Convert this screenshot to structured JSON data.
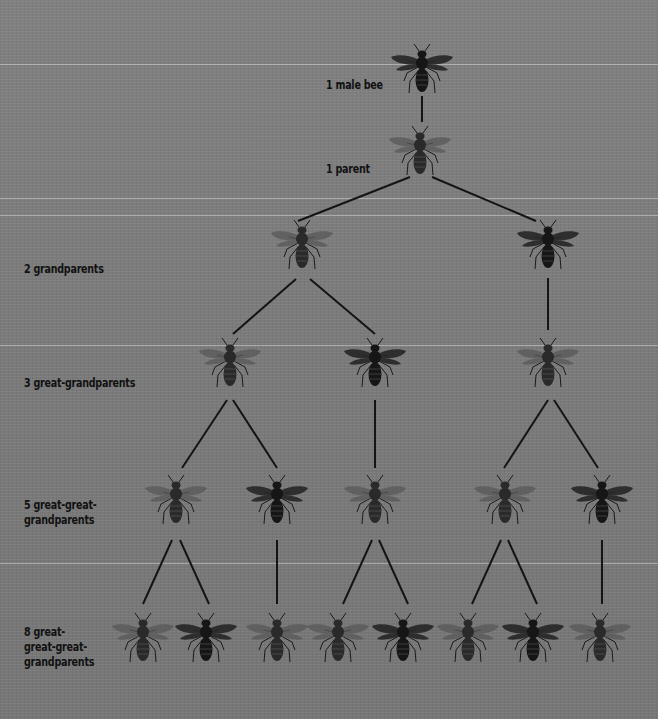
{
  "colors": {
    "background": "#7b7b7b",
    "ink": "#111111",
    "male_bee": "#1e1e1e",
    "female_bee_wing": "#5a5a5a"
  },
  "levels": [
    {
      "label": "1 male bee",
      "count": 1
    },
    {
      "label": "1 parent",
      "count": 1
    },
    {
      "label": "2 grandparents",
      "count": 2
    },
    {
      "label": "3 great-grandparents",
      "count": 3
    },
    {
      "label": "5 great-great-\ngrandparents",
      "count": 5
    },
    {
      "label": "8 great-\ngreat-great-\ngrandparents",
      "count": 8
    }
  ],
  "bees": [
    {
      "row": 0,
      "x": 422,
      "y": 72,
      "type": "drone"
    },
    {
      "row": 1,
      "x": 420,
      "y": 154,
      "type": "queen"
    },
    {
      "row": 2,
      "x": 302,
      "y": 248,
      "type": "queen"
    },
    {
      "row": 2,
      "x": 548,
      "y": 248,
      "type": "drone"
    },
    {
      "row": 3,
      "x": 230,
      "y": 366,
      "type": "queen"
    },
    {
      "row": 3,
      "x": 375,
      "y": 366,
      "type": "drone"
    },
    {
      "row": 3,
      "x": 548,
      "y": 366,
      "type": "queen"
    },
    {
      "row": 4,
      "x": 176,
      "y": 503,
      "type": "queen"
    },
    {
      "row": 4,
      "x": 277,
      "y": 503,
      "type": "drone"
    },
    {
      "row": 4,
      "x": 375,
      "y": 503,
      "type": "queen"
    },
    {
      "row": 4,
      "x": 505,
      "y": 503,
      "type": "queen"
    },
    {
      "row": 4,
      "x": 602,
      "y": 503,
      "type": "drone"
    },
    {
      "row": 5,
      "x": 143,
      "y": 641,
      "type": "queen"
    },
    {
      "row": 5,
      "x": 206,
      "y": 641,
      "type": "drone"
    },
    {
      "row": 5,
      "x": 277,
      "y": 641,
      "type": "queen"
    },
    {
      "row": 5,
      "x": 338,
      "y": 641,
      "type": "queen"
    },
    {
      "row": 5,
      "x": 403,
      "y": 641,
      "type": "drone"
    },
    {
      "row": 5,
      "x": 468,
      "y": 641,
      "type": "queen"
    },
    {
      "row": 5,
      "x": 533,
      "y": 641,
      "type": "drone"
    },
    {
      "row": 5,
      "x": 600,
      "y": 641,
      "type": "queen"
    }
  ],
  "connectors": [
    [
      422,
      96,
      422,
      122
    ],
    [
      410,
      177,
      298,
      221
    ],
    [
      432,
      177,
      536,
      221
    ],
    [
      296,
      279,
      233,
      334
    ],
    [
      310,
      279,
      375,
      334
    ],
    [
      548,
      278,
      548,
      330
    ],
    [
      227,
      400,
      182,
      468
    ],
    [
      233,
      400,
      277,
      468
    ],
    [
      375,
      400,
      375,
      468
    ],
    [
      548,
      400,
      504,
      468
    ],
    [
      554,
      400,
      598,
      468
    ],
    [
      172,
      540,
      143,
      604
    ],
    [
      180,
      540,
      209,
      604
    ],
    [
      277,
      540,
      277,
      604
    ],
    [
      372,
      540,
      343,
      604
    ],
    [
      379,
      540,
      408,
      604
    ],
    [
      501,
      540,
      472,
      604
    ],
    [
      508,
      540,
      537,
      604
    ],
    [
      602,
      540,
      602,
      604
    ]
  ],
  "label_positions": [
    {
      "x": 326,
      "y": 77
    },
    {
      "x": 326,
      "y": 161
    },
    {
      "x": 24,
      "y": 261
    },
    {
      "x": 24,
      "y": 375
    },
    {
      "x": 24,
      "y": 497
    },
    {
      "x": 24,
      "y": 624
    }
  ]
}
